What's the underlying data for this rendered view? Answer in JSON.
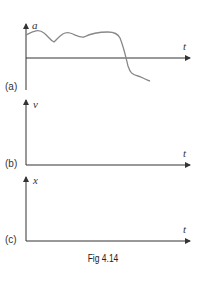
{
  "figure": {
    "caption": "Fig 4.14",
    "graphs": [
      {
        "id": "a",
        "panel_label": "(a)",
        "y_label": "a",
        "x_label": "t"
      },
      {
        "id": "b",
        "panel_label": "(b)",
        "y_label": "v",
        "x_label": "t"
      },
      {
        "id": "c",
        "panel_label": "(c)",
        "y_label": "x",
        "x_label": "t"
      }
    ]
  },
  "colors": {
    "axis": "#333333",
    "curve": "#888888"
  }
}
